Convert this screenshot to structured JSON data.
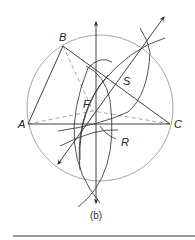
{
  "figure": {
    "caption": "(b)",
    "points": {
      "A": {
        "label": "A",
        "x": 28,
        "y": 124
      },
      "B": {
        "label": "B",
        "x": 63,
        "y": 46
      },
      "C": {
        "label": "C",
        "x": 170,
        "y": 124
      },
      "F": {
        "label": "F",
        "x": 93,
        "y": 105
      },
      "S": {
        "label": "S",
        "x": 124,
        "y": 78
      },
      "R": {
        "label": "R",
        "x": 117,
        "y": 141
      }
    },
    "colors": {
      "line": "#2a2a2a",
      "circle": "#9a9a9a",
      "dashed": "#9a9a9a",
      "rule": "#7a7a7a"
    }
  }
}
